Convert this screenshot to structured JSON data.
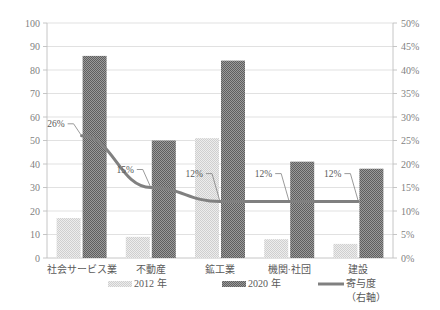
{
  "chart_data": {
    "type": "bar",
    "title": "",
    "subtitle": "",
    "xlabel": "",
    "ylabel": "",
    "categories": [
      "社会サービス業",
      "不動産",
      "鉱工業",
      "機関·社団",
      "建設"
    ],
    "series": [
      {
        "name": "2012 年",
        "axis": "left",
        "type": "bar",
        "values": [
          17,
          9,
          51,
          8,
          6
        ]
      },
      {
        "name": "2020 年",
        "axis": "left",
        "type": "bar",
        "values": [
          86,
          50,
          84,
          41,
          38
        ]
      },
      {
        "name": "寄与度（右軸）",
        "axis": "right",
        "type": "line",
        "values": [
          26,
          15,
          12,
          12,
          12
        ]
      }
    ],
    "data_labels": [
      "26%",
      "15%",
      "12%",
      "12%",
      "12%"
    ],
    "left_axis": {
      "min": 0,
      "max": 100,
      "step": 10,
      "ticks": [
        "0",
        "10",
        "20",
        "30",
        "40",
        "50",
        "60",
        "70",
        "80",
        "90",
        "100"
      ]
    },
    "right_axis": {
      "min": 0,
      "max": 50,
      "step": 5,
      "ticks": [
        "0%",
        "5%",
        "10%",
        "15%",
        "20%",
        "25%",
        "30%",
        "35%",
        "40%",
        "45%",
        "50%"
      ]
    },
    "grid": true,
    "legend_position": "bottom",
    "colors": {
      "series_2012": "#d9d9d9",
      "series_2020": "#808080",
      "line": "#808080",
      "gridline": "#d9d9d9",
      "axis_text": "#7f7f7f",
      "label_text": "#595959",
      "background": "#ffffff"
    }
  },
  "legend": {
    "items": [
      {
        "label": "2012 年",
        "marker": "bar-light-checker-swatch"
      },
      {
        "label": "2020 年",
        "marker": "bar-dark-checker-swatch"
      },
      {
        "label": "寄与度",
        "label2": "（右軸）",
        "marker": "line-swatch"
      }
    ]
  }
}
